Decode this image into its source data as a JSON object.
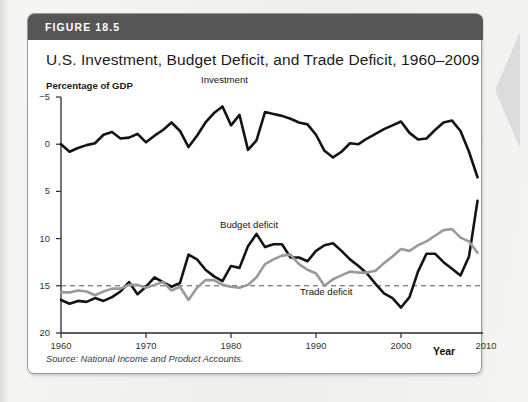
{
  "figure": {
    "header_label": "FIGURE 18.5",
    "title": "U.S. Investment, Budget Deficit, and Trade Deficit, 1960–2009",
    "source": "Source: National Income and Product Accounts.",
    "header_color": "#565656",
    "card_background": "#ffffff"
  },
  "axes": {
    "y_title": "Percentage of GDP",
    "x_title": "Year",
    "y_ticks": [
      "20",
      "15",
      "10",
      "5",
      "0",
      "−5"
    ],
    "x_ticks": [
      "1960",
      "1970",
      "1980",
      "1990",
      "2000",
      "2010"
    ]
  },
  "series_labels": {
    "investment": "Investment",
    "budget_deficit": "Budget deficit",
    "trade_deficit": "Trade deficit"
  },
  "chart_data": {
    "type": "line",
    "title": "U.S. Investment, Budget Deficit, and Trade Deficit, 1960–2009",
    "xlabel": "Year",
    "ylabel": "Percentage of GDP",
    "xlim": [
      1960,
      2010
    ],
    "ylim": [
      -5,
      20
    ],
    "y_ticks": [
      -5,
      0,
      5,
      10,
      15,
      20
    ],
    "x_ticks": [
      1960,
      1970,
      1980,
      1990,
      2000,
      2010
    ],
    "grid": false,
    "legend": "inline-annotations",
    "zero_line": {
      "value": 0,
      "style": "dashed",
      "color": "#555555"
    },
    "x": [
      1960,
      1961,
      1962,
      1963,
      1964,
      1965,
      1966,
      1967,
      1968,
      1969,
      1970,
      1971,
      1972,
      1973,
      1974,
      1975,
      1976,
      1977,
      1978,
      1979,
      1980,
      1981,
      1982,
      1983,
      1984,
      1985,
      1986,
      1987,
      1988,
      1989,
      1990,
      1991,
      1992,
      1993,
      1994,
      1995,
      1996,
      1997,
      1998,
      1999,
      2000,
      2001,
      2002,
      2003,
      2004,
      2005,
      2006,
      2007,
      2008,
      2009
    ],
    "series": [
      {
        "name": "Investment",
        "color": "#141414",
        "width": 2.6,
        "values": [
          15.0,
          14.2,
          14.6,
          14.9,
          15.1,
          16.0,
          16.3,
          15.6,
          15.7,
          16.1,
          15.2,
          15.9,
          16.5,
          17.3,
          16.4,
          14.7,
          15.9,
          17.3,
          18.3,
          19.0,
          17.0,
          18.1,
          14.4,
          15.4,
          18.4,
          18.2,
          18.0,
          17.7,
          17.3,
          17.1,
          16.0,
          14.3,
          13.6,
          14.2,
          15.1,
          15.0,
          15.6,
          16.1,
          16.6,
          17.0,
          17.4,
          16.2,
          15.5,
          15.6,
          16.5,
          17.3,
          17.5,
          16.4,
          14.2,
          11.5
        ]
      },
      {
        "name": "Budget deficit",
        "color": "#141414",
        "width": 2.6,
        "values": [
          -1.5,
          -1.9,
          -1.6,
          -1.7,
          -1.3,
          -1.6,
          -1.2,
          -0.6,
          0.4,
          -0.9,
          -0.1,
          0.9,
          0.4,
          -0.1,
          0.3,
          3.3,
          2.8,
          1.7,
          1.0,
          0.5,
          2.1,
          1.9,
          4.2,
          5.5,
          4.1,
          4.4,
          4.4,
          3.0,
          3.0,
          2.6,
          3.7,
          4.3,
          4.5,
          3.7,
          2.8,
          2.1,
          1.3,
          0.2,
          -0.8,
          -1.3,
          -2.3,
          -1.2,
          1.5,
          3.4,
          3.4,
          2.5,
          1.8,
          1.1,
          3.1,
          9.0
        ]
      },
      {
        "name": "Trade deficit",
        "color": "#9a9a9a",
        "width": 2.6,
        "values": [
          -0.7,
          -0.7,
          -0.5,
          -0.6,
          -1.0,
          -0.6,
          -0.3,
          -0.3,
          0.1,
          0.1,
          -0.2,
          0.1,
          0.4,
          -0.5,
          -0.1,
          -1.5,
          -0.2,
          0.6,
          0.6,
          0.1,
          -0.1,
          -0.2,
          0.1,
          0.9,
          2.3,
          2.8,
          3.2,
          3.3,
          2.3,
          1.7,
          1.3,
          0.0,
          0.7,
          1.1,
          1.5,
          1.4,
          1.4,
          1.6,
          2.4,
          3.1,
          3.9,
          3.7,
          4.3,
          4.7,
          5.3,
          5.9,
          6.0,
          5.1,
          4.7,
          3.5
        ]
      }
    ]
  }
}
